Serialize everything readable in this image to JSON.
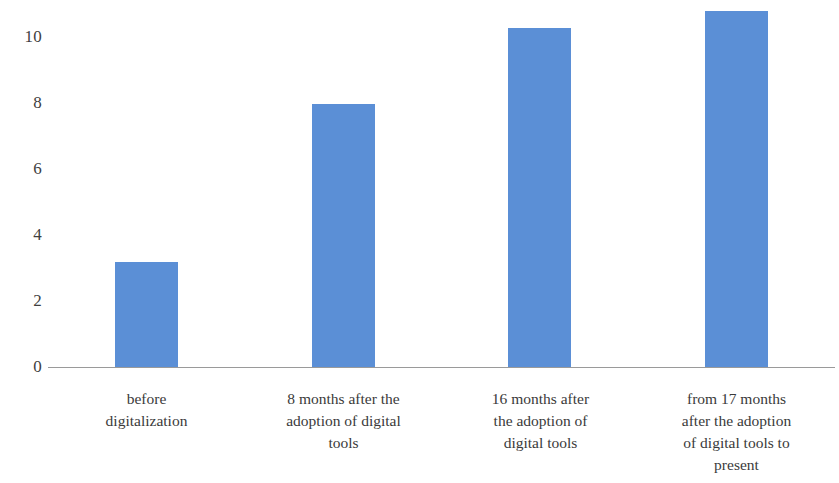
{
  "chart_data": {
    "type": "bar",
    "title": "",
    "subtitle": "",
    "xlabel": "",
    "ylabel": "",
    "categories": [
      "before digitalization",
      "8 months after the adoption of digital tools",
      "16 months after the adoption of digital tools",
      "from 17 months after the adoption of digital tools to present"
    ],
    "category_lines": [
      [
        "before",
        "digitalization"
      ],
      [
        "8 months after the",
        "adoption of digital",
        "tools"
      ],
      [
        "16 months after",
        "the adoption of",
        "digital tools"
      ],
      [
        "from 17 months",
        "after the adoption",
        "of digital tools to",
        "present"
      ]
    ],
    "values": [
      3.2,
      8.0,
      10.3,
      10.8
    ],
    "ylim": [
      0,
      11.2
    ],
    "yticks": [
      0,
      2,
      4,
      6,
      8,
      10
    ],
    "ytick_labels": [
      "0",
      "2",
      "4",
      "6",
      "8",
      "10"
    ],
    "grid": false,
    "legend": false,
    "legend_position": "none",
    "bar_color": "#5b8fd6",
    "axis_color": "#9a9a9a",
    "background_color": "#ffffff",
    "text_color": "#3a3a3a"
  }
}
